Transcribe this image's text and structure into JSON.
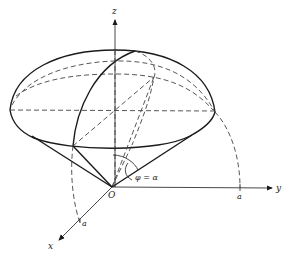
{
  "figure": {
    "axes": {
      "x_label": "x",
      "y_label": "y",
      "z_label": "z",
      "origin_label": "O"
    },
    "ticks": {
      "x_tick": "a",
      "y_tick": "a"
    },
    "angle_label": "φ = α",
    "colors": {
      "ink": "#1a1a1a",
      "background": "#ffffff"
    }
  }
}
